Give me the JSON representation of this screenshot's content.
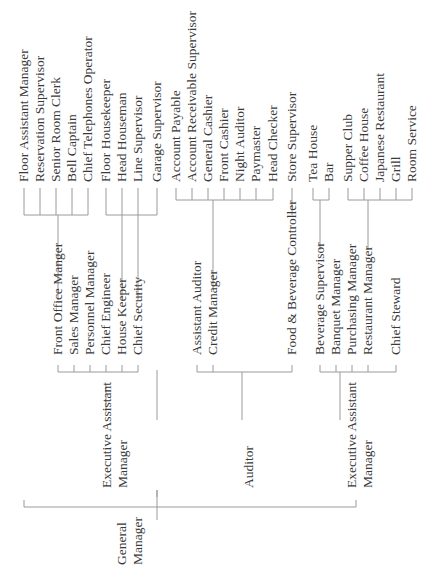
{
  "chart_title": "",
  "root": {
    "label_line1": "General",
    "label_line2": "Manager"
  },
  "level1": [
    {
      "line1": "Executive Assistant",
      "line2": "Manager"
    },
    {
      "line1": "Auditor"
    },
    {
      "line1": "Executive Assistant",
      "line2": "Manager"
    }
  ],
  "level2": [
    "Front Office Manger",
    "Sales Manager",
    "Personnel Manager",
    "Chief Engineer",
    "House Keeper",
    "Chief Security",
    "Assistant Auditor",
    "Credit Manager",
    "Food & Beverage Controller",
    "Beverage Supervisor",
    "Banquet Manager",
    "Purchasing Manager",
    "Restaurant Manager",
    "Chief Steward"
  ],
  "level3": [
    "Floor Assistant Manager",
    "Reservation Supervisor",
    "Senior Room Clerk",
    "Bell Captain",
    "Chief Telephones Operator",
    "Floor Housekeeper",
    "Head Houseman",
    "Line Supervisor",
    "Garage Supervisor",
    "Account Payable",
    "Account Receivable Supervisor",
    "General Cashier",
    "Front Cashier",
    "Night Auditor",
    "Paymaster",
    "Head Checker",
    "Store Supervisor",
    "Tea House",
    "Bar",
    "Supper Club",
    "Coffee House",
    "Japanese Restaurant",
    "Grill",
    "Room Service"
  ],
  "colors": {
    "text": "#3a3a3a",
    "lines": "#9a9a9a",
    "background": "#ffffff"
  }
}
